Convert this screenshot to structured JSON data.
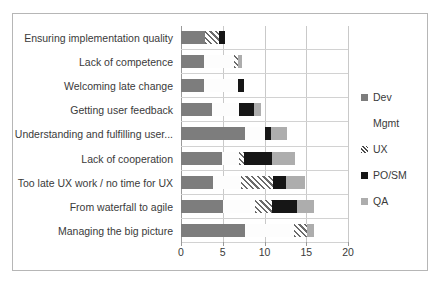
{
  "chart_data": {
    "type": "bar",
    "orientation": "horizontal",
    "stacked": true,
    "title": "",
    "xlabel": "",
    "ylabel": "",
    "xlim": [
      0,
      20
    ],
    "xticks": [
      0,
      5,
      10,
      15,
      20
    ],
    "xtick_labels": [
      "0",
      "5",
      "10",
      "15",
      "20"
    ],
    "grid": true,
    "legend_position": "right",
    "categories": [
      "Ensuring implementation quality",
      "Lack of competence",
      "Welcoming late change",
      "Getting user feedback",
      "Understanding and fulfilling user...",
      "Lack of cooperation",
      "Too late UX work / no time for UX",
      "From waterfall to agile",
      "Managing the big picture"
    ],
    "series": [
      {
        "name": "Dev",
        "color": "#7d7d7d",
        "values": [
          2.9,
          2.7,
          2.7,
          3.7,
          7.7,
          4.9,
          3.8,
          5.0,
          7.7
        ]
      },
      {
        "name": "Mgmt",
        "color": "#fdfdfd",
        "values": [
          0.0,
          3.6,
          4.1,
          3.2,
          2.4,
          2.0,
          3.4,
          3.9,
          5.8
        ]
      },
      {
        "name": "UX",
        "color": "#6b6b6b",
        "values": [
          1.7,
          0.5,
          0.0,
          0.0,
          0.0,
          0.7,
          3.8,
          2.0,
          1.6
        ]
      },
      {
        "name": "PO/SM",
        "color": "#161616",
        "values": [
          0.7,
          0.0,
          0.7,
          1.8,
          0.7,
          3.3,
          1.6,
          3.0,
          0.0
        ]
      },
      {
        "name": "QA",
        "color": "#adadad",
        "values": [
          0.0,
          0.5,
          0.0,
          0.9,
          1.9,
          2.8,
          2.2,
          2.0,
          0.8
        ]
      }
    ],
    "totals": [
      5.3,
      7.3,
      7.5,
      9.6,
      12.7,
      13.7,
      14.8,
      15.9,
      15.9
    ]
  },
  "legend": {
    "items": [
      {
        "label": "Dev",
        "key": "dev-swatch"
      },
      {
        "label": "Mgmt",
        "key": "mgmt-swatch"
      },
      {
        "label": "UX",
        "key": "ux-swatch"
      },
      {
        "label": "PO/SM",
        "key": "posm-swatch"
      },
      {
        "label": "QA",
        "key": "qa-swatch"
      }
    ]
  },
  "colors": {
    "dev": "#7d7d7d",
    "mgmt": "#fdfdfd",
    "ux": "#6b6b6b",
    "posm": "#161616",
    "qa": "#adadad",
    "grid": "#c9c9c9",
    "axis": "#9a9a9a",
    "frame": "#b6b6b6",
    "text": "#3a3a3a"
  }
}
